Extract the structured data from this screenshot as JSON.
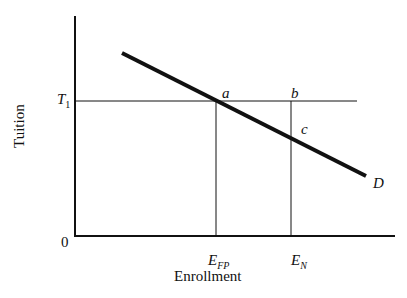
{
  "diagram": {
    "y_axis_label": "Tuition",
    "x_axis_label": "Enrollment",
    "origin_label": "0",
    "price_level": {
      "label": "T",
      "subscript": "1"
    },
    "points": {
      "a": "a",
      "b": "b",
      "c": "c"
    },
    "curve_label": "D",
    "quantities": [
      {
        "label": "E",
        "subscript": "FP"
      },
      {
        "label": "E",
        "subscript": "N"
      }
    ],
    "colors": {
      "line": "#111111",
      "background": "#ffffff"
    }
  }
}
